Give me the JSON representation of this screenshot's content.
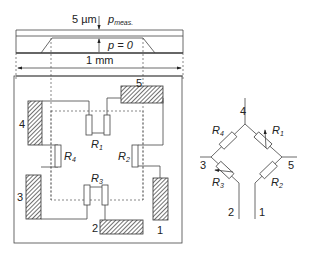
{
  "cross_section": {
    "thickness_label": "5 µm",
    "pressure_meas_label": "p",
    "pressure_meas_sub": "meas.",
    "pressure_zero_label": "p = 0",
    "width_label": "1 mm"
  },
  "layout": {
    "pads": [
      {
        "id": "1",
        "label": "1"
      },
      {
        "id": "2",
        "label": "2"
      },
      {
        "id": "3",
        "label": "3"
      },
      {
        "id": "4",
        "label": "4"
      },
      {
        "id": "5",
        "label": "5"
      }
    ],
    "resistors": [
      {
        "id": "R1",
        "label": "R",
        "sub": "1"
      },
      {
        "id": "R2",
        "label": "R",
        "sub": "2"
      },
      {
        "id": "R3",
        "label": "R",
        "sub": "3"
      },
      {
        "id": "R4",
        "label": "R",
        "sub": "4"
      }
    ]
  },
  "bridge": {
    "nodes": [
      "4",
      "3",
      "5",
      "2",
      "1"
    ],
    "resistors": [
      {
        "id": "R4",
        "label": "R",
        "sub": "4",
        "variable": false
      },
      {
        "id": "R1",
        "label": "R",
        "sub": "1",
        "variable": true
      },
      {
        "id": "R3",
        "label": "R",
        "sub": "3",
        "variable": true
      },
      {
        "id": "R2",
        "label": "R",
        "sub": "2",
        "variable": false
      }
    ]
  },
  "colors": {
    "line": "#444444",
    "hatch": "#333333",
    "background": "#ffffff"
  }
}
